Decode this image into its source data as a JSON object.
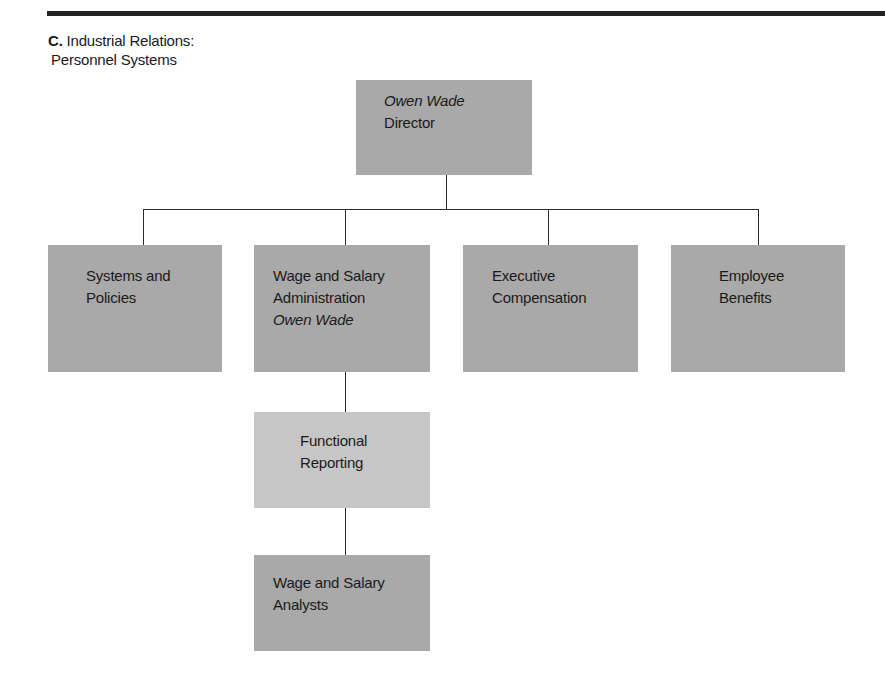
{
  "heading": {
    "letter": "C.",
    "line1": "Industrial Relations:",
    "line2": "Personnel Systems"
  },
  "chart": {
    "director": {
      "name": "Owen Wade",
      "title": "Director"
    },
    "departments": [
      {
        "line1": "Systems and",
        "line2": "Policies"
      },
      {
        "line1": "Wage and Salary",
        "line2": "Administration",
        "person": "Owen Wade"
      },
      {
        "line1": "Executive",
        "line2": "Compensation"
      },
      {
        "line1": "Employee",
        "line2": "Benefits"
      }
    ],
    "functional_reporting": {
      "line1": "Functional",
      "line2": "Reporting"
    },
    "analysts": {
      "line1": "Wage and Salary",
      "line2": "Analysts"
    }
  },
  "colors": {
    "box_dark": "#a9a9a9",
    "box_light": "#c6c6c6",
    "line": "#2a2a2a",
    "rule": "#222222"
  }
}
